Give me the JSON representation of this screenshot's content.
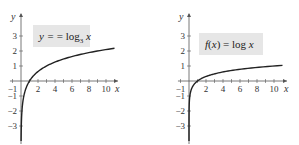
{
  "chart_data": [
    {
      "type": "line",
      "title": "y = log3 x",
      "label": {
        "main": "y = log",
        "sub": "3",
        "tail": " x"
      },
      "xlabel": "x",
      "ylabel": "y",
      "xlim": [
        -1,
        11
      ],
      "ylim": [
        -3.5,
        3.5
      ],
      "xticks": [
        "-1",
        "2",
        "4",
        "6",
        "8",
        "10"
      ],
      "yticks": [
        "3",
        "2",
        "1",
        "-1",
        "-2",
        "-3"
      ],
      "base": 3,
      "series": [
        {
          "name": "log3 x",
          "x": [
            0.02,
            0.05,
            0.1,
            0.2,
            0.5,
            1,
            2,
            3,
            4,
            6,
            8,
            10,
            11
          ],
          "values": [
            -3.56,
            -2.73,
            -2.1,
            -1.46,
            -0.63,
            0,
            0.63,
            1,
            1.26,
            1.63,
            1.89,
            2.1,
            2.18
          ]
        }
      ],
      "grid": false
    },
    {
      "type": "line",
      "title": "f(x) = log x",
      "label": {
        "main": "f(x) = log x"
      },
      "xlabel": "x",
      "ylabel": "y",
      "xlim": [
        -1,
        11
      ],
      "ylim": [
        -3.5,
        3.5
      ],
      "xticks": [
        "-1",
        "2",
        "4",
        "6",
        "8",
        "10"
      ],
      "yticks": [
        "3",
        "2",
        "1",
        "-1",
        "-2",
        "-3"
      ],
      "base": 10,
      "series": [
        {
          "name": "log x",
          "x": [
            0.0005,
            0.001,
            0.01,
            0.1,
            0.5,
            1,
            2,
            4,
            6,
            8,
            10,
            11
          ],
          "values": [
            -3.3,
            -3,
            -2,
            -1,
            -0.3,
            0,
            0.3,
            0.6,
            0.78,
            0.9,
            1,
            1.04
          ]
        }
      ],
      "grid": false
    }
  ]
}
